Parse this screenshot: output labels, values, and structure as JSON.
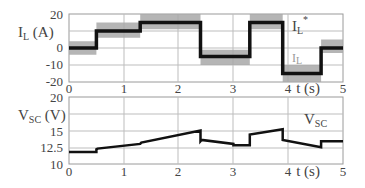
{
  "chart_data": [
    {
      "type": "line",
      "panel": "top",
      "ylabel": "I_L (A)",
      "xlabel": "t (s)",
      "xlim": [
        0,
        5
      ],
      "ylim": [
        -20,
        20
      ],
      "xticks": [
        "0",
        "1",
        "2",
        "3",
        "4",
        "5"
      ],
      "yticks": [
        "20",
        "10",
        "0",
        "-10",
        "-20"
      ],
      "grid": true,
      "annotations": [
        "I_L*",
        "I_L"
      ],
      "series": [
        {
          "name": "I_L*",
          "style": "step",
          "color": "#111111",
          "x": [
            0,
            0.5,
            0.5,
            1.3,
            1.3,
            2.4,
            2.4,
            3.3,
            3.3,
            3.9,
            3.9,
            4.6,
            4.6,
            5
          ],
          "values": [
            0,
            0,
            10,
            10,
            15,
            15,
            -5,
            -5,
            15,
            15,
            -15,
            -15,
            0,
            0
          ]
        },
        {
          "name": "I_L",
          "style": "band",
          "color": "#9a9a9a",
          "x": [
            0,
            0.5,
            0.5,
            1.3,
            1.3,
            2.4,
            2.4,
            3.3,
            3.3,
            3.9,
            3.9,
            4.6,
            4.6,
            5
          ],
          "upper": [
            4,
            4,
            15,
            15,
            20,
            20,
            -1,
            -1,
            20,
            20,
            -10,
            -10,
            5,
            5
          ],
          "lower": [
            -4,
            -4,
            6,
            6,
            11,
            11,
            -10,
            -10,
            11,
            11,
            -20,
            -20,
            -3,
            -3
          ]
        }
      ]
    },
    {
      "type": "line",
      "panel": "bottom",
      "ylabel": "V_SC (V)",
      "xlabel": "t (s)",
      "xlim": [
        0,
        5
      ],
      "ylim": [
        10,
        20
      ],
      "xticks": [
        "0",
        "1",
        "2",
        "3",
        "4",
        "5"
      ],
      "yticks": [
        "20",
        "15",
        "12.5",
        "10"
      ],
      "grid": true,
      "annotations": [
        "V_SC"
      ],
      "series": [
        {
          "name": "V_SC",
          "color": "#111111",
          "x": [
            0,
            0.5,
            0.5,
            0.52,
            1.3,
            1.32,
            2.4,
            2.4,
            2.42,
            3.0,
            3.0,
            3.3,
            3.3,
            3.9,
            3.9,
            4.6,
            4.6,
            5
          ],
          "values": [
            11.8,
            11.8,
            12.2,
            12.3,
            13.0,
            13.2,
            15.0,
            13.4,
            13.6,
            13.0,
            12.8,
            12.8,
            14.4,
            15.2,
            13.6,
            12.5,
            13.4,
            13.4
          ]
        }
      ]
    }
  ],
  "labels": {
    "top_ylabel_main": "I",
    "top_ylabel_sub": "L",
    "top_ylabel_unit": " (A)",
    "bottom_ylabel_main": "V",
    "bottom_ylabel_sub": "SC",
    "bottom_ylabel_unit": " (V)",
    "xlabel": "t (s)",
    "legend_ref_main": "I",
    "legend_ref_sub": "L",
    "legend_ref_sup": "*",
    "legend_meas_main": "I",
    "legend_meas_sub": "L",
    "legend_vsc_main": "V",
    "legend_vsc_sub": "SC"
  }
}
